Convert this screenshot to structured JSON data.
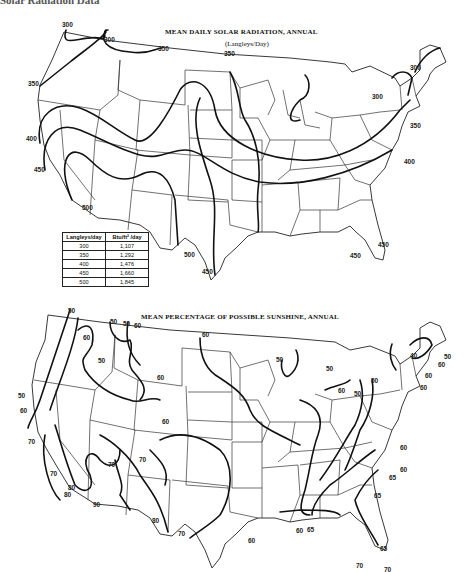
{
  "page": {
    "header_partial": "Solar Radiation Data"
  },
  "map_top": {
    "title": "MEAN DAILY SOLAR RADIATION, ANNUAL",
    "subtitle": "(Langleys/Day)",
    "contour_labels": [
      "300",
      "300",
      "350",
      "350",
      "350",
      "400",
      "450",
      "500",
      "500",
      "450",
      "300",
      "300",
      "350",
      "400",
      "450",
      "450"
    ],
    "conversion_table": {
      "headers": [
        "Langleys/day",
        "Btu/ft² /day"
      ],
      "rows": [
        [
          "300",
          "1,107"
        ],
        [
          "350",
          "1,292"
        ],
        [
          "400",
          "1,476"
        ],
        [
          "450",
          "1,660"
        ],
        [
          "500",
          "1,845"
        ]
      ]
    }
  },
  "map_bottom": {
    "title": "MEAN PERCENTAGE OF POSSIBLE SUNSHINE, ANNUAL",
    "contour_labels": [
      "50",
      "50",
      "50",
      "60",
      "60",
      "60",
      "50",
      "60",
      "50",
      "60",
      "70",
      "60",
      "70",
      "70",
      "70",
      "80",
      "80",
      "90",
      "80",
      "70",
      "50",
      "50",
      "50",
      "50",
      "40",
      "50",
      "60",
      "60",
      "60",
      "60",
      "60",
      "60",
      "65",
      "65",
      "60",
      "65",
      "60",
      "65",
      "70",
      "70"
    ]
  }
}
